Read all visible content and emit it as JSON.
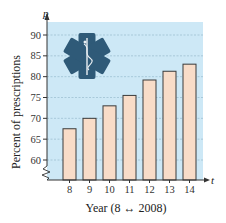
{
  "chart_data": {
    "type": "bar",
    "title": "",
    "xlabel": "Year (8 ↔ 2008)",
    "ylabel": "Percent of prescriptions",
    "x_axis_variable": "t",
    "y_axis_variable": "p",
    "categories": [
      "8",
      "9",
      "10",
      "11",
      "12",
      "13",
      "14"
    ],
    "values": [
      67.5,
      70.0,
      73.0,
      75.5,
      79.2,
      81.3,
      83.0
    ],
    "ylim": [
      60,
      90
    ],
    "y_ticks": [
      "60",
      "65",
      "70",
      "75",
      "80",
      "85",
      "90"
    ],
    "y_axis_break": true,
    "grid": true,
    "legend": null,
    "icon": "star-of-life-icon"
  },
  "colors": {
    "plot_background": "#cde8f6",
    "bar_fill": "#f8dcc8",
    "bar_stroke": "#3a3a3a",
    "gridline": "#8fb3c8",
    "icon": "#2f5a78",
    "axis": "#333333"
  }
}
